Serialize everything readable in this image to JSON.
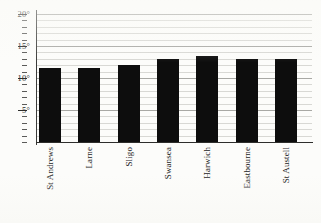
{
  "chart_data": {
    "type": "bar",
    "title": "",
    "xlabel": "",
    "ylabel": "",
    "categories": [
      "St Andrews",
      "Larne",
      "Sligo",
      "Swansea",
      "Harwich",
      "Eastbourne",
      "St Austell"
    ],
    "values": [
      11.5,
      11.5,
      12,
      13,
      13.5,
      13,
      13
    ],
    "unit": "°",
    "ylim": [
      0,
      20
    ],
    "grid": true,
    "legend": false,
    "y_major_ticks": [
      20,
      15,
      10,
      5
    ],
    "y_tick_labels": [
      "20°",
      "15°",
      "10°",
      "5°"
    ],
    "y_minor_tick_interval": 1,
    "bar_color": "#0d0d0d",
    "gridline_color": "#d8d8d4",
    "major_gridline_color": "#a8a8a4",
    "axis_color": "#2e2e2c",
    "background_color": "#fcfcfa"
  }
}
